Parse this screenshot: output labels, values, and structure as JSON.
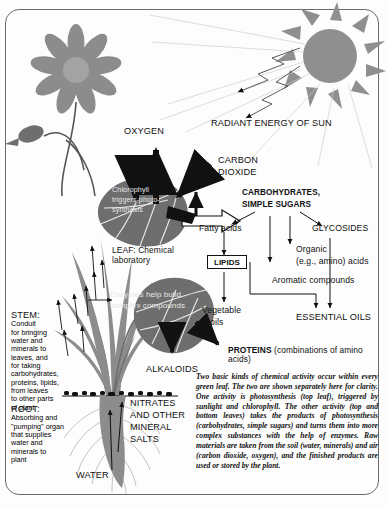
{
  "diagram": {
    "colors": {
      "ink": "#111111",
      "plant_gray": "#8c8c8c",
      "plant_dark": "#6e6e6e",
      "sun_gray": "#8f8f8f",
      "border": "#6b6b6b",
      "background": "#fdfdfd"
    }
  },
  "labels": {
    "oxygen": "OXYGEN",
    "carbon_dioxide_l1": "CARBON",
    "carbon_dioxide_l2": "DIOXIDE",
    "radiant_energy": "RADIANT ENERGY OF SUN",
    "chlorophyll_l1": "Chlorophyll",
    "chlorophyll_l2": "triggers photo-",
    "chlorophyll_l3": "synthesis",
    "leaf_l1": "LEAF: Chemical",
    "leaf_l2": "laboratory",
    "enzymes_l1": "Enzymes help build",
    "enzymes_l2": "complex compounds",
    "alkaloids": "ALKALOIDS",
    "nitrates_l1": "NITRATES",
    "nitrates_l2": "AND OTHER",
    "nitrates_l3": "MINERAL",
    "nitrates_l4": "SALTS",
    "water": "WATER"
  },
  "stem": {
    "heading": "STEM:",
    "lines": [
      "Conduit",
      "for bringing",
      "water and",
      "minerals to",
      "leaves, and",
      "for taking",
      "carbohydrates,",
      "proteins, lipids,",
      "from leaves",
      "to other parts",
      "of plant"
    ]
  },
  "root": {
    "heading": "ROOT:",
    "lines": [
      "Absorbing and",
      "\"pumping\" organ",
      "that supplies",
      "water and",
      "minerals to",
      "plant"
    ]
  },
  "chemistry": {
    "carbohydrates_l1": "CARBOHYDRATES,",
    "carbohydrates_l2": "SIMPLE SUGARS",
    "fatty_acids": "Fatty acids",
    "glycosides": "GLYCOSIDES",
    "organic_l1": "Organic",
    "organic_l2": "(e.g., amino) acids",
    "aromatic": "Aromatic compounds",
    "lipids": "LIPIDS",
    "vegetable_l1": "Vegetable",
    "vegetable_l2": "oils",
    "essential_oils": "ESSENTIAL OILS",
    "proteins_bold": "PROTEINS",
    "proteins_rest": " (combinations of amino acids)"
  },
  "caption": {
    "text": "Two basic kinds of chemical activity occur within every green leaf. The two are shown separately here for clarity. One activity is photosynthesis (top leaf), triggered by sunlight and chlorophyll. The other activity (top and bottom leaves) takes the products of photosynthesis (carbohydrates, simple sugars) and turns them into more complex substances with the help of enzymes. Raw materials are taken from the soil (water, minerals) and air (carbon dioxide, oxygen), and the finished products are used or stored by the plant."
  }
}
